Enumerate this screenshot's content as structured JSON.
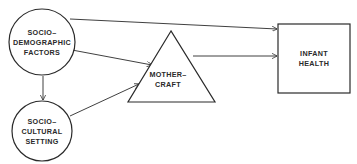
{
  "diagram": {
    "nodes": [
      {
        "id": "socio-demographic",
        "shape": "circle",
        "lines": [
          "SOCIO–",
          "DEMOGRAPHIC",
          "FACTORS"
        ]
      },
      {
        "id": "socio-cultural",
        "shape": "circle",
        "lines": [
          "SOCIO–",
          "CULTURAL",
          "SETTING"
        ]
      },
      {
        "id": "mothercraft",
        "shape": "triangle",
        "lines": [
          "MOTHER–",
          "CRAFT"
        ]
      },
      {
        "id": "infant-health",
        "shape": "rectangle",
        "lines": [
          "INFANT",
          "HEALTH"
        ]
      }
    ],
    "edges": [
      {
        "from": "socio-demographic",
        "to": "infant-health"
      },
      {
        "from": "socio-demographic",
        "to": "mothercraft"
      },
      {
        "from": "socio-demographic",
        "to": "socio-cultural"
      },
      {
        "from": "socio-cultural",
        "to": "mothercraft"
      },
      {
        "from": "mothercraft",
        "to": "infant-health"
      }
    ],
    "colors": {
      "stroke": "#2a2a2a",
      "fill": "#ffffff",
      "background": "#ffffff"
    }
  }
}
